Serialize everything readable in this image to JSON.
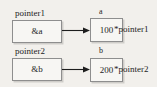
{
  "diagram": {
    "type": "pointer-memory-diagram",
    "background_color": "#f2f0ec",
    "box_border_color": "#8e8e8e",
    "text_color": "#1d1d1d",
    "rows": [
      {
        "pointer_label": "pointer1",
        "pointer_value": "&a",
        "variable_label": "a",
        "variable_value": "100",
        "deref_label": "*pointer1",
        "arrow": "right-arrow-icon"
      },
      {
        "pointer_label": "pointer2",
        "pointer_value": "&b",
        "variable_label": "b",
        "variable_value": "200",
        "deref_label": "*pointer2",
        "arrow": "right-arrow-icon"
      }
    ]
  }
}
